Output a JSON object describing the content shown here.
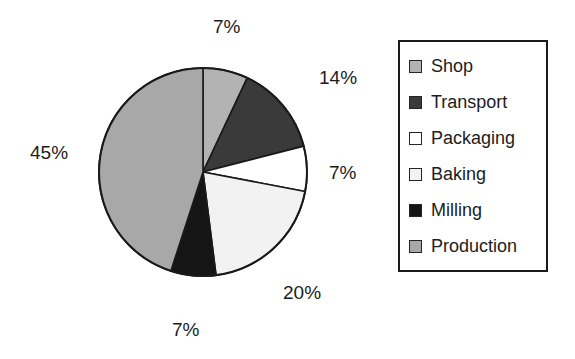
{
  "chart_data": {
    "type": "pie",
    "title": "",
    "subtitle": "",
    "xlabel": "",
    "ylabel": "",
    "grid": false,
    "legend_position": "right",
    "start_angle_deg": 0,
    "direction": "clockwise",
    "value_unit": "%",
    "categories": [
      "Shop",
      "Transport",
      "Packaging",
      "Baking",
      "Milling",
      "Production"
    ],
    "values": [
      7,
      14,
      7,
      20,
      7,
      45
    ],
    "labels": [
      "7%",
      "14%",
      "7%",
      "20%",
      "7%",
      "45%"
    ],
    "colors": [
      "#b3b3b3",
      "#3a3a3a",
      "#ffffff",
      "#f2f2f2",
      "#151515",
      "#a8a8a8"
    ],
    "slices": [
      {
        "name": "Shop",
        "value": 7,
        "label": "7%",
        "color": "#b3b3b3"
      },
      {
        "name": "Transport",
        "value": 14,
        "label": "14%",
        "color": "#3a3a3a"
      },
      {
        "name": "Packaging",
        "value": 7,
        "label": "7%",
        "color": "#ffffff"
      },
      {
        "name": "Baking",
        "value": 20,
        "label": "20%",
        "color": "#f2f2f2"
      },
      {
        "name": "Milling",
        "value": 7,
        "label": "7%",
        "color": "#151515"
      },
      {
        "name": "Production",
        "value": 45,
        "label": "45%",
        "color": "#a8a8a8"
      }
    ],
    "annotations": [
      {
        "text": "7%",
        "for": "Shop",
        "position": "top"
      },
      {
        "text": "14%",
        "for": "Transport",
        "position": "upper-right"
      },
      {
        "text": "7%",
        "for": "Packaging",
        "position": "right"
      },
      {
        "text": "20%",
        "for": "Baking",
        "position": "lower-right"
      },
      {
        "text": "7%",
        "for": "Milling",
        "position": "bottom"
      },
      {
        "text": "45%",
        "for": "Production",
        "position": "left"
      }
    ]
  },
  "legend": {
    "items": [
      {
        "label": "Shop",
        "color": "#b3b3b3"
      },
      {
        "label": "Transport",
        "color": "#3a3a3a"
      },
      {
        "label": "Packaging",
        "color": "#ffffff"
      },
      {
        "label": "Baking",
        "color": "#f2f2f2"
      },
      {
        "label": "Milling",
        "color": "#151515"
      },
      {
        "label": "Production",
        "color": "#a8a8a8"
      }
    ]
  }
}
